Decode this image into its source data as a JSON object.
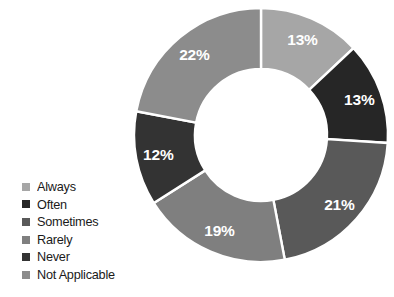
{
  "chart_data": {
    "type": "pie",
    "variant": "donut",
    "title": "",
    "subtitle": "",
    "xlabel": "",
    "ylabel": "",
    "grid": false,
    "legend_position": "left",
    "hole_ratio": 0.52,
    "start_angle_deg": 0,
    "direction": "clockwise",
    "value_unit": "%",
    "categories": [
      "Always",
      "Often",
      "Sometimes",
      "Rarely",
      "Never",
      "Not Applicable"
    ],
    "values": [
      13,
      13,
      21,
      19,
      12,
      22
    ],
    "labels": [
      "13%",
      "13%",
      "21%",
      "19%",
      "12%",
      "22%"
    ],
    "colors": [
      "#a6a6a6",
      "#262626",
      "#595959",
      "#7f7f7f",
      "#333333",
      "#8c8c8c"
    ],
    "slices": [
      {
        "name": "Always",
        "value": 13,
        "label": "13%",
        "color": "#a6a6a6",
        "label_color": "#ffffff"
      },
      {
        "name": "Often",
        "value": 13,
        "label": "13%",
        "color": "#262626",
        "label_color": "#ffffff"
      },
      {
        "name": "Sometimes",
        "value": 21,
        "label": "21%",
        "color": "#595959",
        "label_color": "#ffffff"
      },
      {
        "name": "Rarely",
        "value": 19,
        "label": "19%",
        "color": "#7f7f7f",
        "label_color": "#ffffff"
      },
      {
        "name": "Never",
        "value": 12,
        "label": "12%",
        "color": "#333333",
        "label_color": "#ffffff"
      },
      {
        "name": "Not Applicable",
        "value": 22,
        "label": "22%",
        "color": "#8c8c8c",
        "label_color": "#ffffff"
      }
    ]
  },
  "legend": {
    "items": [
      {
        "label": "Always",
        "color": "#a6a6a6"
      },
      {
        "label": "Often",
        "color": "#262626"
      },
      {
        "label": "Sometimes",
        "color": "#595959"
      },
      {
        "label": "Rarely",
        "color": "#7f7f7f"
      },
      {
        "label": "Never",
        "color": "#333333"
      },
      {
        "label": "Not Applicable",
        "color": "#8c8c8c"
      }
    ]
  },
  "canvas": {
    "background": "#ffffff",
    "slice_border_color": "#ffffff"
  }
}
